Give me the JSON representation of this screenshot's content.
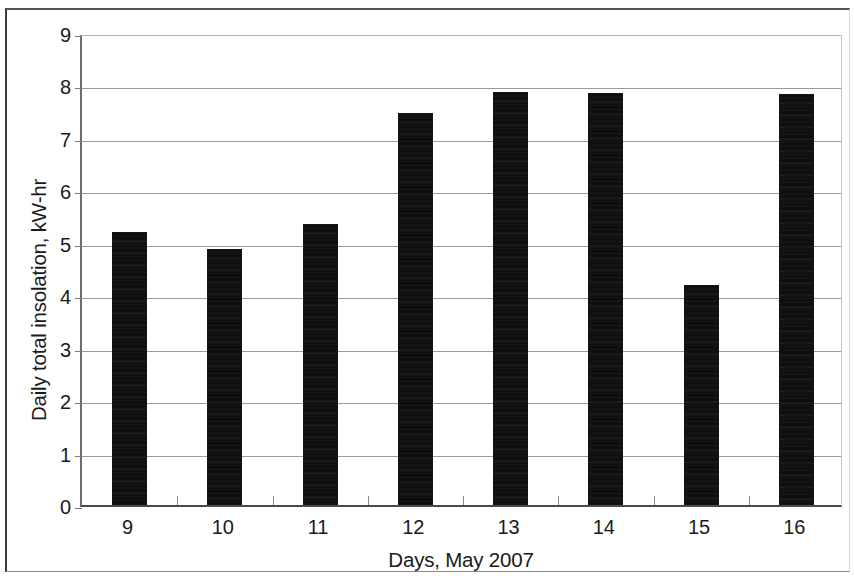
{
  "chart_data": {
    "type": "bar",
    "title": "",
    "xlabel": "Days, May 2007",
    "ylabel": "Daily total insolation, kW-hr",
    "categories": [
      "9",
      "10",
      "11",
      "12",
      "13",
      "14",
      "15",
      "16"
    ],
    "values": [
      5.2,
      4.88,
      5.35,
      7.48,
      7.87,
      7.85,
      4.19,
      7.84
    ],
    "series": [
      {
        "name": "Daily total insolation",
        "values": [
          5.2,
          4.88,
          5.35,
          7.48,
          7.87,
          7.85,
          4.19,
          7.84
        ]
      }
    ],
    "ylim": [
      0,
      9
    ],
    "ytick_labels": [
      "0",
      "1",
      "2",
      "3",
      "4",
      "5",
      "6",
      "7",
      "8",
      "9"
    ],
    "ytick_values": [
      0,
      1,
      2,
      3,
      4,
      5,
      6,
      7,
      8,
      9
    ],
    "grid": true,
    "grid_axis": "y",
    "legend": false,
    "legend_position": "none",
    "bar_color": "#0b0b0b",
    "grid_color": "#9a9a9a",
    "axis_color": "#4a4a4a",
    "background_color": "#ffffff"
  }
}
